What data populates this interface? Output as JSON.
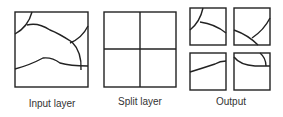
{
  "diagram": {
    "panels": [
      {
        "id": "input",
        "label": "Input layer"
      },
      {
        "id": "split",
        "label": "Split layer"
      },
      {
        "id": "output",
        "label": "Output"
      }
    ],
    "colors": {
      "stroke": "#222222",
      "text": "#333333",
      "background": "#ffffff"
    }
  }
}
